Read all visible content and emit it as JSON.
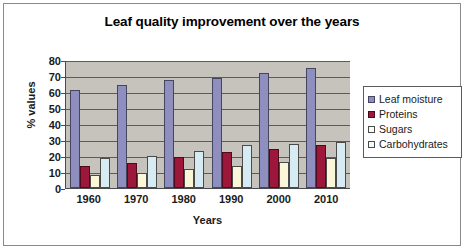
{
  "chart_data": {
    "type": "bar",
    "title": "Leaf quality improvement over the years",
    "xlabel": "Years",
    "ylabel": "% values",
    "categories": [
      "1960",
      "1970",
      "1980",
      "1990",
      "2000",
      "2010"
    ],
    "series": [
      {
        "name": "Leaf moisture",
        "color": "#8f8fbf",
        "values": [
          61.5,
          64.5,
          67.5,
          69,
          72,
          75
        ]
      },
      {
        "name": "Proteins",
        "color": "#9c173a",
        "values": [
          14,
          15.5,
          19.5,
          22.5,
          24.5,
          27
        ]
      },
      {
        "name": "Sugars",
        "color": "#fbf6d8",
        "values": [
          8,
          9.5,
          12,
          13.5,
          16.5,
          19
        ]
      },
      {
        "name": "Carbohydrates",
        "color": "#d7ecf2",
        "values": [
          18.5,
          20,
          23,
          27,
          27.5,
          29
        ]
      }
    ],
    "ylim": [
      0,
      80
    ],
    "yticks": [
      0,
      10,
      20,
      30,
      40,
      50,
      60,
      70,
      80
    ],
    "grid": true,
    "legend_position": "right",
    "plot_background": "#c6c3bc"
  }
}
